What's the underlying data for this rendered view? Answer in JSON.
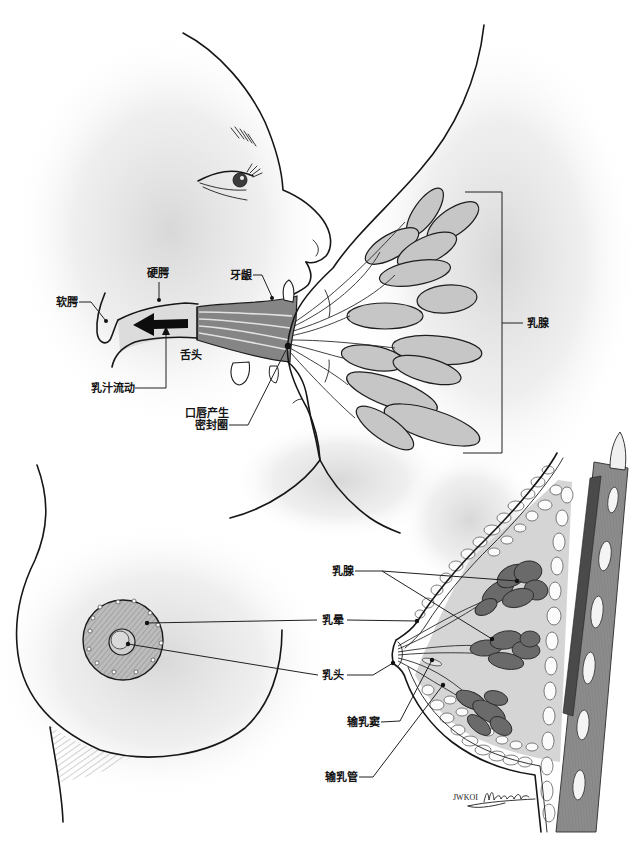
{
  "top_figure": {
    "labels": {
      "soft_palate": "软腭",
      "hard_palate": "硬腭",
      "gum": "牙龈",
      "tongue": "舌头",
      "milk_flow": "乳汁流动",
      "lip_seal_line1": "口唇产生",
      "lip_seal_line2": "密封圈",
      "mammary_gland": "乳腺"
    }
  },
  "bottom_figure": {
    "labels": {
      "mammary_gland": "乳腺",
      "areola": "乳晕",
      "nipple": "乳头",
      "lactiferous_sinus": "输乳窦",
      "lactiferous_duct": "输乳管"
    },
    "signature": "JWKOI"
  },
  "colors": {
    "outline": "#161616",
    "lobe_light": "#c6c6c6",
    "lobe_dark": "#6a6a6a",
    "muscle": "#8c8c8c",
    "shading": "#dcdcdc"
  }
}
